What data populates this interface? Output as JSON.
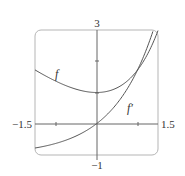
{
  "chart_data": {
    "type": "line",
    "title": "",
    "xlabel": "",
    "ylabel": "",
    "xlim": [
      -1.5,
      1.5
    ],
    "ylim": [
      -1,
      3
    ],
    "grid": false,
    "tick_labels": {
      "x_min": "−1.5",
      "x_max": "1.5",
      "y_max": "3",
      "y_min": "−1"
    },
    "series": [
      {
        "name": "f",
        "label": "f",
        "x": [
          -1.5,
          -1.0,
          -0.5,
          0.0,
          0.5,
          1.0,
          1.5
        ],
        "values": [
          1.72,
          1.37,
          1.11,
          1.0,
          1.15,
          1.72,
          2.98
        ]
      },
      {
        "name": "f'",
        "label": "f′",
        "x": [
          -1.5,
          -1.0,
          -0.5,
          0.0,
          0.5,
          1.0,
          1.5
        ],
        "values": [
          -0.78,
          -0.63,
          -0.39,
          0.0,
          0.65,
          1.72,
          3.48
        ]
      }
    ],
    "annotations": [
      "f",
      "f′"
    ],
    "line_color": "#555555"
  }
}
